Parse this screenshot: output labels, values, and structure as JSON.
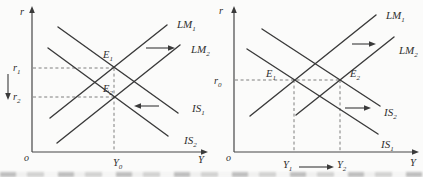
{
  "colors": {
    "ink": "#3a3a3a",
    "dashed_line": "#6f6f6f",
    "paper": "#fbfbfa"
  },
  "left": {
    "axis_r": "r",
    "axis_y": "Y",
    "origin": "o",
    "labels": {
      "lm1": {
        "main": "LM",
        "sub": "1"
      },
      "lm2": {
        "main": "LM",
        "sub": "2"
      },
      "is1": {
        "main": "IS",
        "sub": "1"
      },
      "is2": {
        "main": "IS",
        "sub": "2"
      }
    },
    "points": {
      "e1": {
        "main": "E",
        "sub": "1"
      },
      "e2": {
        "main": "E",
        "sub": "2"
      }
    },
    "ticks": {
      "r1": {
        "main": "r",
        "sub": "1"
      },
      "r2": {
        "main": "r",
        "sub": "2"
      },
      "y0": {
        "main": "Y",
        "sub": "0"
      }
    }
  },
  "right": {
    "axis_r": "r",
    "axis_y": "Y",
    "origin": "o",
    "labels": {
      "lm1": {
        "main": "LM",
        "sub": "1"
      },
      "lm2": {
        "main": "LM",
        "sub": "2"
      },
      "is1": {
        "main": "IS",
        "sub": "1"
      },
      "is2": {
        "main": "IS",
        "sub": "2"
      }
    },
    "points": {
      "e1": {
        "main": "E",
        "sub": "1"
      },
      "e2": {
        "main": "E",
        "sub": "2"
      }
    },
    "ticks": {
      "r0": {
        "main": "r",
        "sub": "0"
      },
      "y1": {
        "main": "Y",
        "sub": "1"
      },
      "y2": {
        "main": "Y",
        "sub": "2"
      }
    }
  }
}
